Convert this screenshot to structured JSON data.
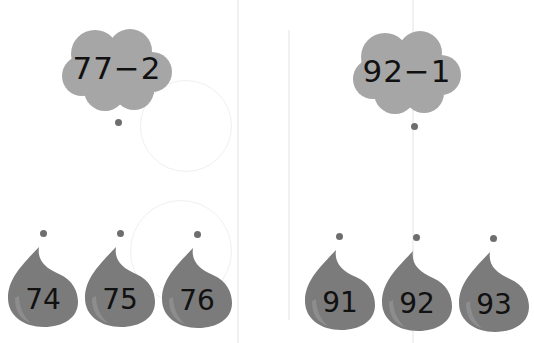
{
  "colors": {
    "cloud_fill": "#a6a6a6",
    "drop_fill": "#7b7b7b",
    "drop_highlight": "#9a9a9a",
    "dot": "#6e6e6e",
    "text": "#111111"
  },
  "groups": [
    {
      "expression": "77−2",
      "options": [
        "74",
        "75",
        "76"
      ]
    },
    {
      "expression": "92−1",
      "options": [
        "91",
        "92",
        "93"
      ]
    }
  ]
}
